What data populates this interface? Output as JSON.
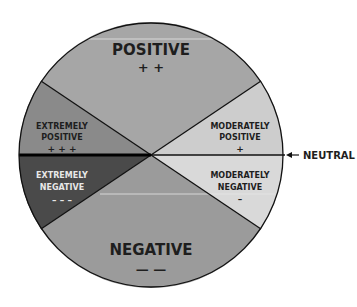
{
  "diagram": {
    "type": "sentiment-wheel",
    "center": {
      "x": 151,
      "y": 155
    },
    "radius": 132,
    "segments": [
      {
        "id": "positive",
        "title": "POSITIVE",
        "symbol": "+ +",
        "color": "#a6a6a6"
      },
      {
        "id": "moderately-positive",
        "title_line1": "MODERATELY",
        "title_line2": "POSITIVE",
        "symbol": "+",
        "color": "#cdcdcd"
      },
      {
        "id": "moderately-negative",
        "title_line1": "MODERATELY",
        "title_line2": "NEGATIVE",
        "symbol": "–",
        "color": "#d9d9d9"
      },
      {
        "id": "negative",
        "title": "NEGATIVE",
        "symbol": "— —",
        "color": "#9b9b9b"
      },
      {
        "id": "extremely-negative",
        "title_line1": "EXTREMELY",
        "title_line2": "NEGATIVE",
        "symbol": "– – –",
        "color": "#4a4a4a"
      },
      {
        "id": "extremely-positive",
        "title_line1": "EXTREMELY",
        "title_line2": "POSITIVE",
        "symbol": "+ + +",
        "color": "#8a8a8a"
      }
    ],
    "neutral_label": "NEUTRAL"
  }
}
